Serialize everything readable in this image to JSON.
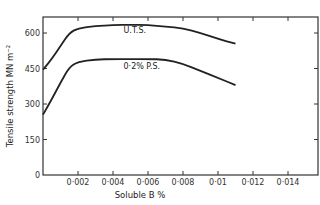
{
  "chart_data": {
    "type": "line",
    "title": "",
    "xlabel": "Soluble  B %",
    "ylabel": "Tensile strength  MN m⁻²",
    "xlim": [
      0,
      0.0153
    ],
    "ylim": [
      0,
      660
    ],
    "x_ticks": [
      0.002,
      0.004,
      0.006,
      0.008,
      0.01,
      0.012,
      0.014
    ],
    "x_tick_labels": [
      "0·002",
      "0·004",
      "0·006",
      "0·008",
      "0·01",
      "0·012",
      "0·014"
    ],
    "y_ticks": [
      0,
      150,
      300,
      450,
      600
    ],
    "y_tick_labels": [
      "0",
      "150",
      "300",
      "450",
      "600"
    ],
    "grid": false,
    "legend": "inline labels",
    "series": [
      {
        "name": "U.T.S.",
        "label_pos": [
          0.0046,
          600
        ],
        "x": [
          0,
          0.0005,
          0.001,
          0.0015,
          0.002,
          0.003,
          0.004,
          0.005,
          0.006,
          0.007,
          0.008,
          0.009,
          0.01,
          0.011
        ],
        "values": [
          445,
          490,
          545,
          600,
          620,
          630,
          633,
          635,
          633,
          628,
          620,
          600,
          575,
          555
        ]
      },
      {
        "name": "0·2% P.S.",
        "label_pos": [
          0.0046,
          450
        ],
        "x": [
          0,
          0.0005,
          0.001,
          0.0015,
          0.002,
          0.003,
          0.004,
          0.005,
          0.006,
          0.007,
          0.008,
          0.009,
          0.01,
          0.011
        ],
        "values": [
          255,
          320,
          390,
          455,
          478,
          488,
          490,
          490,
          490,
          488,
          470,
          440,
          410,
          380
        ]
      }
    ]
  }
}
